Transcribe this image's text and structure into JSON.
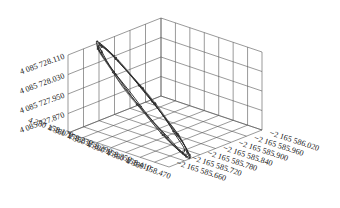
{
  "chart_data": {
    "type": "line3d",
    "title": "",
    "grid": true,
    "axes": {
      "x": {
        "label": "",
        "tick_labels": [
          "4 380 158.170",
          "4 380 158.230",
          "4 380 158.290",
          "4 380 158.350",
          "4 380 158.410",
          "4 380 158.470"
        ],
        "range": [
          4380158.14,
          4380158.5
        ]
      },
      "y": {
        "label": "",
        "tick_labels": [
          "−2 165 585.660",
          "−2 165 585.720",
          "−2 165 585.780",
          "−2 165 585.840",
          "−2 165 585.900",
          "−2 165 585.960",
          "−2 165 586.020"
        ],
        "range": [
          -2165586.05,
          -2165585.63
        ]
      },
      "z": {
        "label": "",
        "tick_labels": [
          "4 085 727.870",
          "4 085 727.950",
          "4 085 728.030",
          "4 085 728.110"
        ],
        "range": [
          4085727.83,
          4085728.15
        ]
      }
    },
    "series": [
      {
        "name": "trajectory",
        "description": "Several overlapping closed loops forming a tilted elliptical orbit, dark grey lines with small point markers",
        "loops": 5,
        "approx_points": [
          {
            "x": 4380158.21,
            "y": -2165585.98,
            "z": 4085728.11
          },
          {
            "x": 4380158.24,
            "y": -2165586.0,
            "z": 4085728.09
          },
          {
            "x": 4380158.3,
            "y": -2165585.98,
            "z": 4085728.02
          },
          {
            "x": 4380158.36,
            "y": -2165585.94,
            "z": 4085727.94
          },
          {
            "x": 4380158.4,
            "y": -2165585.88,
            "z": 4085727.88
          },
          {
            "x": 4380158.4,
            "y": -2165585.82,
            "z": 4085727.86
          },
          {
            "x": 4380158.36,
            "y": -2165585.78,
            "z": 4085727.88
          },
          {
            "x": 4380158.3,
            "y": -2165585.78,
            "z": 4085727.92
          },
          {
            "x": 4380158.24,
            "y": -2165585.82,
            "z": 4085727.98
          },
          {
            "x": 4380158.2,
            "y": -2165585.88,
            "z": 4085728.04
          },
          {
            "x": 4380158.19,
            "y": -2165585.94,
            "z": 4085728.09
          }
        ]
      }
    ]
  }
}
